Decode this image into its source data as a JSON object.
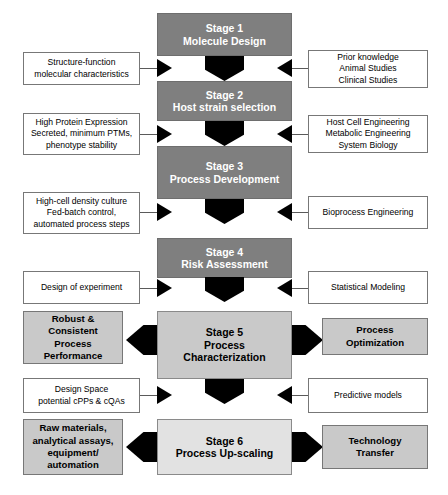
{
  "diagram": {
    "colors": {
      "stage_dark": "#7f7f7f",
      "stage_mid": "#c9c9c9",
      "stage_light": "#e2e2e2",
      "outcome_box": "#c9c9c9",
      "arrow": "#000000",
      "box_border": "#777777",
      "line": "#5a5a5a",
      "page_background": "#ffffff"
    },
    "stages": [
      {
        "id": "stage-1",
        "number_label": "Stage 1",
        "name_label": "Molecule Design",
        "fill": "dark"
      },
      {
        "id": "stage-2",
        "number_label": "Stage 2",
        "name_label": "Host strain selection",
        "fill": "dark"
      },
      {
        "id": "stage-3",
        "number_label": "Stage 3",
        "name_label": "Process Development",
        "fill": "dark"
      },
      {
        "id": "stage-4",
        "number_label": "Stage 4",
        "name_label": "Risk Assessment",
        "fill": "dark"
      },
      {
        "id": "stage-5",
        "number_label": "Stage 5",
        "name_label_line1": "Process",
        "name_label_line2": "Characterization",
        "fill": "mid"
      },
      {
        "id": "stage-6",
        "number_label": "Stage 6",
        "name_label": "Process Up-scaling",
        "fill": "light"
      }
    ],
    "left_inputs": [
      {
        "id": "left-input-1",
        "line1": "Structure-function",
        "line2": "molecular characteristics",
        "line3": "",
        "line4": ""
      },
      {
        "id": "left-input-2",
        "line1": "High Protein Expression",
        "line2": "Secreted, minimum PTMs,",
        "line3": "phenotype stability",
        "line4": ""
      },
      {
        "id": "left-input-3",
        "line1": "High-cell density culture",
        "line2": "Fed-batch control,",
        "line3": "automated process steps",
        "line4": ""
      },
      {
        "id": "left-input-4",
        "line1": "Design of experiment",
        "line2": "",
        "line3": "",
        "line4": ""
      },
      {
        "id": "left-input-5",
        "line1": "Design Space",
        "line2": "potential cPPs & cQAs",
        "line3": "",
        "line4": ""
      }
    ],
    "right_inputs": [
      {
        "id": "right-input-1",
        "line1": "Prior knowledge",
        "line2": "Animal Studies",
        "line3": "Clinical Studies"
      },
      {
        "id": "right-input-2",
        "line1": "Host Cell Engineering",
        "line2": "Metabolic Engineering",
        "line3": "System Biology"
      },
      {
        "id": "right-input-3",
        "line1": "Bioprocess Engineering",
        "line2": "",
        "line3": ""
      },
      {
        "id": "right-input-4",
        "line1": "Statistical Modeling",
        "line2": "",
        "line3": ""
      },
      {
        "id": "right-input-5",
        "line1": "Predictive models",
        "line2": "",
        "line3": ""
      }
    ],
    "left_outcomes": [
      {
        "id": "left-outcome-stage-5",
        "line1": "Robust &",
        "line2": "Consistent",
        "line3": "Process",
        "line4": "Performance"
      },
      {
        "id": "left-outcome-stage-6",
        "line1": "Raw materials,",
        "line2": "analytical assays,",
        "line3": "equipment/",
        "line4": "automation"
      }
    ],
    "right_outcomes": [
      {
        "id": "right-outcome-stage-5",
        "line1": "Process",
        "line2": "Optimization",
        "line3": "",
        "line4": ""
      },
      {
        "id": "right-outcome-stage-6",
        "line1": "Technology",
        "line2": "Transfer",
        "line3": "",
        "line4": ""
      }
    ],
    "caption": ""
  }
}
